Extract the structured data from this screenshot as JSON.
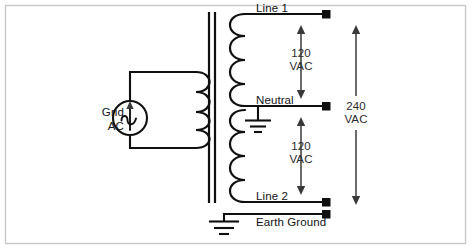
{
  "diagram": {
    "frame_color": "#c9c9c9",
    "wire_color": "#101010",
    "dimension_color": "#3a3a3a",
    "source": {
      "label_line1": "Grid",
      "label_line2": "AC",
      "symbol": "ac-source-icon"
    },
    "transformer": {
      "primary_name": "primary-winding",
      "secondary_upper_name": "secondary-winding-upper",
      "secondary_lower_name": "secondary-winding-lower",
      "core_name": "transformer-core"
    },
    "terminals": [
      {
        "id": "line-1",
        "label": "Line 1",
        "y": 14
      },
      {
        "id": "neutral",
        "label": "Neutral",
        "y": 106
      },
      {
        "id": "line-2",
        "label": "Line 2",
        "y": 202
      },
      {
        "id": "earth-ground",
        "label": "Earth Ground",
        "y": 214
      }
    ],
    "dimensions": [
      {
        "id": "upper-120",
        "value": "120",
        "unit": "VAC",
        "from": "line-1",
        "to": "neutral"
      },
      {
        "id": "lower-120",
        "value": "120",
        "unit": "VAC",
        "from": "neutral",
        "to": "line-2"
      },
      {
        "id": "total-240",
        "value": "240",
        "unit": "VAC",
        "from": "line-1",
        "to": "line-2"
      }
    ],
    "grounds": [
      {
        "id": "neutral-ground",
        "name": "neutral-ground-icon"
      },
      {
        "id": "earth-ground",
        "name": "earth-ground-icon"
      }
    ]
  }
}
